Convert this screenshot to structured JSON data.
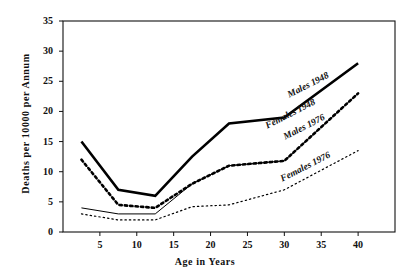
{
  "chart_data": {
    "type": "line",
    "title": "",
    "xlabel": "Age in Years",
    "ylabel": "Deaths per 10000 per Annum",
    "xlim": [
      0,
      45
    ],
    "ylim": [
      0,
      35
    ],
    "xticks": [
      5,
      10,
      15,
      20,
      25,
      30,
      35,
      40
    ],
    "yticks": [
      0,
      5,
      10,
      15,
      20,
      25,
      30,
      35
    ],
    "grid": false,
    "legend": "inline-labels",
    "series": [
      {
        "name": "Males 1948",
        "style": "thick-solid",
        "color": "#000000",
        "x": [
          2.5,
          7.5,
          12.5,
          17.5,
          22.5,
          30,
          40
        ],
        "values": [
          15,
          7,
          6,
          12.5,
          18,
          19,
          28
        ]
      },
      {
        "name": "Females 1948",
        "style": "thick-dotted",
        "color": "#000000",
        "x": [
          2.5,
          7.5,
          12.5,
          17.5,
          22.5,
          30,
          40
        ],
        "values": [
          12,
          4.5,
          4,
          8,
          11,
          11.8,
          23
        ]
      },
      {
        "name": "Males 1976",
        "style": "thin-solid",
        "color": "#000000",
        "x": [
          2.5,
          7.5,
          12.5,
          17.5,
          22.5,
          30,
          40
        ],
        "values": [
          4,
          3,
          3,
          8,
          11,
          11.8,
          23
        ]
      },
      {
        "name": "Females 1976",
        "style": "fine-dotted",
        "color": "#000000",
        "x": [
          2.5,
          7.5,
          12.5,
          17.5,
          22.5,
          30,
          40
        ],
        "values": [
          3,
          2,
          2,
          4.2,
          4.5,
          7,
          13.5
        ]
      }
    ],
    "annotations": [
      {
        "text": "Males 1948",
        "x": 30.5,
        "y": 22.5,
        "rotation": -27
      },
      {
        "text": "Females 1948",
        "x": 27.5,
        "y": 17.5,
        "rotation": -27
      },
      {
        "text": "Males 1976",
        "x": 30.0,
        "y": 15.6,
        "rotation": -27
      },
      {
        "text": "Females 1976",
        "x": 29.5,
        "y": 8.6,
        "rotation": -27
      }
    ]
  }
}
